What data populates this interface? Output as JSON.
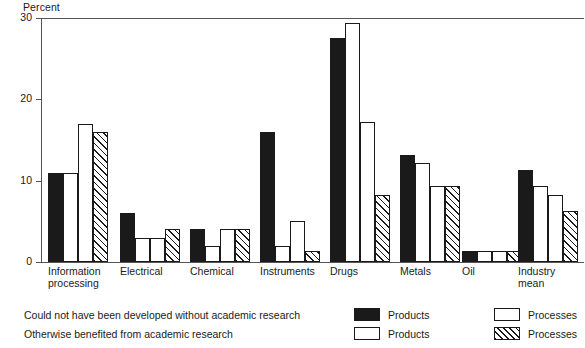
{
  "chart_data": {
    "type": "bar",
    "title": "",
    "subtitle": "",
    "xlabel": "",
    "ylabel": "Percent",
    "ylim": [
      0,
      30
    ],
    "yticks": [
      0,
      10,
      20,
      30
    ],
    "ytick_labels": [
      "0",
      "10",
      "20",
      "30"
    ],
    "grid": false,
    "legend_position": "below-right",
    "categories": [
      "Information\nprocessing",
      "Electrical",
      "Chemical",
      "Instruments",
      "Drugs",
      "Metals",
      "Oil",
      "Industry mean"
    ],
    "series": [
      {
        "name": "Could not have been developed without academic research — Products",
        "short_name": "Products",
        "group_label": "Could not have been developed without academic research",
        "pattern": "solid",
        "color": "#1a1a1a",
        "values": [
          11,
          6,
          4,
          16,
          27.5,
          13.2,
          1.3,
          11.3
        ]
      },
      {
        "name": "Could not have been developed without academic research — Processes",
        "short_name": "Processes",
        "group_label": "Could not have been developed without academic research",
        "pattern": "open",
        "color": "#ffffff",
        "values": [
          11,
          3,
          2,
          2,
          29.4,
          12.2,
          1.3,
          9.3
        ]
      },
      {
        "name": "Otherwise benefited from academic research — Products",
        "short_name": "Products",
        "group_label": "Otherwise benefited from academic research",
        "pattern": "open",
        "color": "#ffffff",
        "values": [
          17,
          3,
          4,
          5,
          17.2,
          9.3,
          1.3,
          8.3
        ]
      },
      {
        "name": "Otherwise benefited from academic research — Processes",
        "short_name": "Processes",
        "group_label": "Otherwise benefited from academic research",
        "pattern": "hatch",
        "color": "#ffffff",
        "values": [
          16,
          4,
          4,
          1.3,
          8.3,
          9.3,
          1.3,
          6.3
        ]
      }
    ]
  },
  "legend": {
    "rows": [
      {
        "description": "Could not have been developed without academic research",
        "entries": [
          {
            "pattern": "solid",
            "label": "Products"
          },
          {
            "pattern": "open",
            "label": "Processes"
          }
        ]
      },
      {
        "description": "Otherwise benefited from academic research",
        "entries": [
          {
            "pattern": "open",
            "label": "Products"
          },
          {
            "pattern": "hatch",
            "label": "Processes"
          }
        ]
      }
    ]
  }
}
